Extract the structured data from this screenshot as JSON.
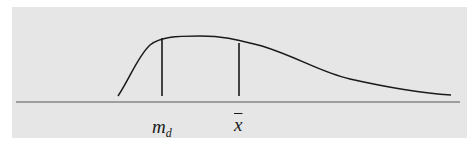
{
  "figure": {
    "curve": {
      "type": "right-skewed density",
      "path": "M 118 96 C 130 78, 138 56, 150 45 C 160 37, 175 36, 200 36 C 225 36, 238 40, 262 46 C 300 58, 320 72, 350 79 C 390 88, 420 93, 451 95",
      "stroke": "#1a1a1a",
      "stroke_width": 1.5
    },
    "baseline": {
      "x1": 16,
      "x2": 460,
      "y": 102,
      "stroke": "#555555"
    },
    "markers": [
      {
        "id": "median",
        "x": 162,
        "y_top": 38,
        "y_bottom": 96
      },
      {
        "id": "mean",
        "x": 239,
        "y_top": 43,
        "y_bottom": 96
      }
    ],
    "labels": {
      "median_main": "m",
      "median_sub": "d",
      "mean": "x"
    },
    "colors": {
      "panel_bg": "#e6e6e6",
      "page_bg": "#ffffff",
      "ink": "#1a1a1a"
    }
  }
}
